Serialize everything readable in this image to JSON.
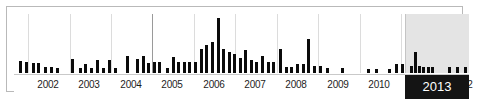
{
  "widget": {
    "name": "publication-year-histogram",
    "type": "date-range-facet-histogram"
  },
  "colors": {
    "bar": "#0b0b0b",
    "frame": "#b9b9b9",
    "gridline": "#dcdcdc",
    "gridline_strong": "#9a9a9a",
    "selection_band": "#e4e4e4",
    "selection_label_bg": "#141414",
    "selection_label_text": "#ffffff",
    "background": "#ffffff"
  },
  "axis": {
    "labels": [
      {
        "text": "2002",
        "center_pct": 7.9
      },
      {
        "text": "2003",
        "center_pct": 17.6
      },
      {
        "text": "2004",
        "center_pct": 27.3
      },
      {
        "text": "2005",
        "center_pct": 37.0
      },
      {
        "text": "2006",
        "center_pct": 46.7
      },
      {
        "text": "2007",
        "center_pct": 56.4
      },
      {
        "text": "2008",
        "center_pct": 66.1
      },
      {
        "text": "2009",
        "center_pct": 75.8
      },
      {
        "text": "2010",
        "center_pct": 85.5
      },
      {
        "text": "2011",
        "center_pct": 95.2
      },
      {
        "text": "2012",
        "center_pct": 104.9
      }
    ]
  },
  "selection": {
    "label": "2013",
    "band_left_pct": 91.5,
    "band_width_pct": 8.5,
    "label_left_pct": 91.5,
    "label_width_pct": 8.5
  },
  "chart_data": {
    "type": "bar",
    "title": "",
    "xlabel": "",
    "ylabel": "",
    "grid": true,
    "legend": null,
    "x_tick_labels": [
      "2002",
      "2003",
      "2004",
      "2005",
      "2006",
      "2007",
      "2008",
      "2009",
      "2010",
      "2011",
      "2012",
      "2013"
    ],
    "x_range": [
      "2001-07",
      "2013-06"
    ],
    "ylim": [
      0,
      100
    ],
    "bin": "month",
    "note": "Counts are relative heights read off the bars; tallest bar = 100.",
    "gridlines_pct": [
      3.3,
      13.0,
      22.7,
      32.4,
      42.1,
      51.8,
      61.5,
      71.2,
      80.9,
      90.6,
      91.5
    ],
    "strong_gridline_pct": 32.4,
    "values": [
      {
        "x_pct": 1.1,
        "h": 23
      },
      {
        "x_pct": 2.6,
        "h": 21
      },
      {
        "x_pct": 4.2,
        "h": 20
      },
      {
        "x_pct": 5.5,
        "h": 20
      },
      {
        "x_pct": 7.0,
        "h": 12
      },
      {
        "x_pct": 8.4,
        "h": 12
      },
      {
        "x_pct": 9.9,
        "h": 10
      },
      {
        "x_pct": 13.4,
        "h": 26
      },
      {
        "x_pct": 15.2,
        "h": 11
      },
      {
        "x_pct": 16.5,
        "h": 18
      },
      {
        "x_pct": 17.8,
        "h": 11
      },
      {
        "x_pct": 19.2,
        "h": 25
      },
      {
        "x_pct": 20.6,
        "h": 11
      },
      {
        "x_pct": 21.9,
        "h": 25
      },
      {
        "x_pct": 23.4,
        "h": 11
      },
      {
        "x_pct": 26.2,
        "h": 33
      },
      {
        "x_pct": 28.6,
        "h": 26
      },
      {
        "x_pct": 29.9,
        "h": 33
      },
      {
        "x_pct": 31.2,
        "h": 19
      },
      {
        "x_pct": 32.5,
        "h": 21
      },
      {
        "x_pct": 33.8,
        "h": 21
      },
      {
        "x_pct": 35.6,
        "h": 11
      },
      {
        "x_pct": 36.9,
        "h": 31
      },
      {
        "x_pct": 38.2,
        "h": 21
      },
      {
        "x_pct": 39.5,
        "h": 21
      },
      {
        "x_pct": 40.8,
        "h": 21
      },
      {
        "x_pct": 42.2,
        "h": 21
      },
      {
        "x_pct": 43.5,
        "h": 45
      },
      {
        "x_pct": 44.8,
        "h": 52
      },
      {
        "x_pct": 46.1,
        "h": 58
      },
      {
        "x_pct": 47.4,
        "h": 100
      },
      {
        "x_pct": 48.7,
        "h": 45
      },
      {
        "x_pct": 50.0,
        "h": 40
      },
      {
        "x_pct": 51.3,
        "h": 35
      },
      {
        "x_pct": 52.6,
        "h": 28
      },
      {
        "x_pct": 53.9,
        "h": 42
      },
      {
        "x_pct": 55.2,
        "h": 25
      },
      {
        "x_pct": 56.5,
        "h": 21
      },
      {
        "x_pct": 57.8,
        "h": 33
      },
      {
        "x_pct": 59.2,
        "h": 21
      },
      {
        "x_pct": 60.5,
        "h": 21
      },
      {
        "x_pct": 62.0,
        "h": 45
      },
      {
        "x_pct": 63.4,
        "h": 12
      },
      {
        "x_pct": 64.7,
        "h": 12
      },
      {
        "x_pct": 66.0,
        "h": 18
      },
      {
        "x_pct": 67.3,
        "h": 18
      },
      {
        "x_pct": 68.6,
        "h": 62
      },
      {
        "x_pct": 70.0,
        "h": 14
      },
      {
        "x_pct": 71.4,
        "h": 14
      },
      {
        "x_pct": 73.0,
        "h": 10
      },
      {
        "x_pct": 76.5,
        "h": 10
      },
      {
        "x_pct": 82.7,
        "h": 9
      },
      {
        "x_pct": 84.6,
        "h": 9
      },
      {
        "x_pct": 87.6,
        "h": 9
      },
      {
        "x_pct": 89.2,
        "h": 18
      },
      {
        "x_pct": 90.5,
        "h": 18
      },
      {
        "x_pct": 92.6,
        "h": 14
      },
      {
        "x_pct": 93.6,
        "h": 40
      },
      {
        "x_pct": 94.6,
        "h": 14
      },
      {
        "x_pct": 95.6,
        "h": 12
      },
      {
        "x_pct": 96.6,
        "h": 12
      },
      {
        "x_pct": 97.6,
        "h": 12
      },
      {
        "x_pct": 101.7,
        "h": 12
      },
      {
        "x_pct": 103.5,
        "h": 12
      },
      {
        "x_pct": 105.3,
        "h": 12
      }
    ]
  }
}
